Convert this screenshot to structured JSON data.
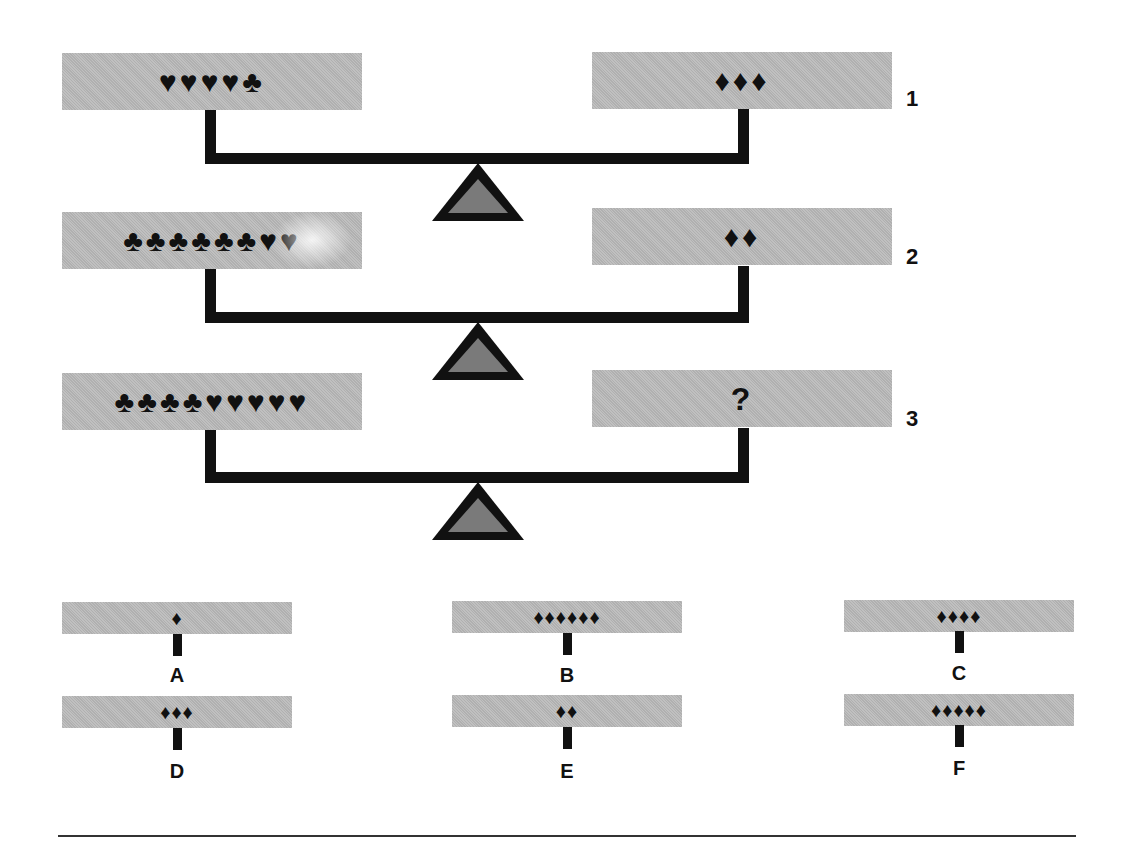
{
  "puzzle": {
    "scales": [
      {
        "number": "1",
        "left_pan": "♥♥♥♥♣",
        "right_pan": "♦♦♦"
      },
      {
        "number": "2",
        "left_pan": "♣♣♣♣♣♣♥♥",
        "right_pan": "♦♦"
      },
      {
        "number": "3",
        "left_pan": "♣♣♣♣♥♥♥♥♥",
        "right_pan": "?"
      }
    ],
    "options": [
      {
        "label": "A",
        "symbols": "♦"
      },
      {
        "label": "B",
        "symbols": "♦♦♦♦♦♦"
      },
      {
        "label": "C",
        "symbols": "♦♦♦♦"
      },
      {
        "label": "D",
        "symbols": "♦♦♦"
      },
      {
        "label": "E",
        "symbols": "♦♦"
      },
      {
        "label": "F",
        "symbols": "♦♦♦♦♦"
      }
    ]
  },
  "colors": {
    "pan_fill": "#b9b9b9",
    "ink": "#111111",
    "fulcrum_fill": "#7a7a7a"
  }
}
